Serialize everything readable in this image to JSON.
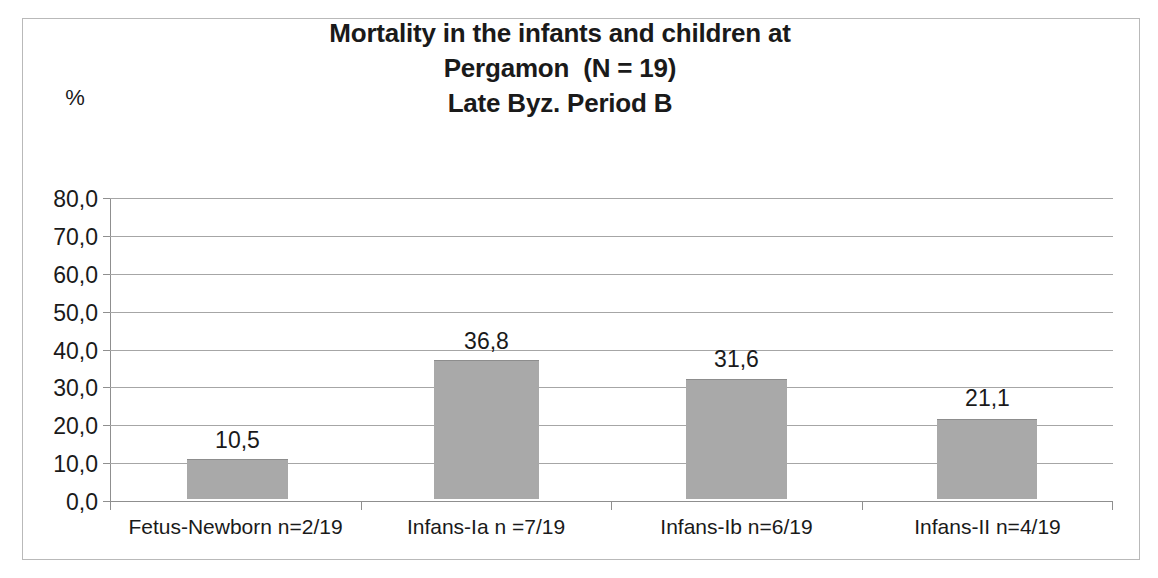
{
  "chart_data": {
    "type": "bar",
    "title": "Mortality in the infants and children at Pergamon  (N = 19) Late Byz. Period B",
    "title_lines": [
      "Mortality in the infants and children at",
      "Pergamon  (N = 19)",
      "Late Byz. Period B"
    ],
    "xlabel": "",
    "ylabel": "%",
    "ylim": [
      0,
      80
    ],
    "grid": true,
    "legend": "none",
    "y_ticks": [
      "80,0",
      "70,0",
      "60,0",
      "50,0",
      "40,0",
      "30,0",
      "20,0",
      "10,0",
      "0,0"
    ],
    "y_tick_values": [
      80,
      70,
      60,
      50,
      40,
      30,
      20,
      10,
      0
    ],
    "categories": [
      "Fetus-Newborn n=2/19",
      "Infans-Ia n =7/19",
      "Infans-Ib n=6/19",
      "Infans-II n=4/19"
    ],
    "values": [
      10.5,
      36.8,
      31.6,
      21.1
    ],
    "value_labels": [
      "10,5",
      "36,8",
      "31,6",
      "21,1"
    ],
    "bar_color": "#a9a9a9",
    "gridline_color": "#a6a6a6",
    "axis_color": "#8f8f8f",
    "text_color": "#1a1a1a",
    "frame_color": "#b9b9b9",
    "background": "#ffffff"
  }
}
